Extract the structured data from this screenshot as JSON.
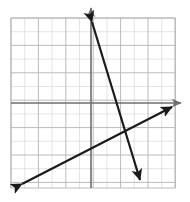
{
  "figure": {
    "name": "coordinate-plane-two-lines",
    "width": 190,
    "height": 202,
    "background_color": "#ffffff"
  },
  "grid": {
    "left": 11,
    "top": 18,
    "right": 175,
    "bottom": 188,
    "cell_size": 13.7,
    "columns": 12,
    "rows": 12,
    "minor_color": "#d9d9d9",
    "major_color": "#b3b3b3",
    "major_every": 2,
    "show_border": true
  },
  "axes": {
    "color": "#6e6e6e",
    "stroke_width": 1.6,
    "x_axis": {
      "label": "x-axis",
      "y_pixel": 103,
      "x_start": 11,
      "x_end": 181,
      "arrow": "right"
    },
    "y_axis": {
      "label": "y-axis",
      "x_pixel": 91,
      "y_start": 188,
      "y_end": 8,
      "arrow": "up"
    },
    "origin": {
      "x_pixel": 91,
      "y_pixel": 103
    },
    "unit_pixels": 13.7
  },
  "chart_data": {
    "type": "line",
    "title": "",
    "subtitle": "",
    "xlabel": "x",
    "ylabel": "y",
    "xlim": [
      -5.8,
      6.1
    ],
    "ylim": [
      -6.2,
      6.2
    ],
    "grid": true,
    "legend": "none",
    "annotations": [],
    "tick_labels": {
      "x": [],
      "y": []
    },
    "intersection": {
      "x": 2.6,
      "y": -2.2,
      "x_pixel": 126,
      "y_pixel": 133
    },
    "series": [
      {
        "name": "steep-decreasing-line",
        "color": "#1a1a1a",
        "stroke_width": 2.2,
        "slope": -3.3,
        "y_intercept": 5.9,
        "x_intercept": 2.3,
        "arrows": [
          "start-up",
          "end-down"
        ],
        "points_graph": [
          {
            "x": 0.07,
            "y": 5.91
          },
          {
            "x": 3.58,
            "y": -5.62
          }
        ],
        "points_pixel": [
          {
            "x": 92,
            "y": 22
          },
          {
            "x": 140,
            "y": 180
          }
        ]
      },
      {
        "name": "shallow-increasing-line",
        "color": "#1a1a1a",
        "stroke_width": 2.2,
        "slope": 0.51,
        "y_intercept": -3.1,
        "x_intercept": 6.0,
        "arrows": [
          "start-down-left",
          "end-up-right"
        ],
        "points_graph": [
          {
            "x": -5.04,
            "y": -5.91
          },
          {
            "x": 5.91,
            "y": -0.29
          }
        ],
        "points_pixel": [
          {
            "x": 22,
            "y": 184
          },
          {
            "x": 172,
            "y": 107
          }
        ]
      }
    ]
  },
  "icons": {
    "x_axis_arrow": "arrow-right-icon",
    "y_axis_arrow": "arrow-up-icon",
    "line_a_start_arrow": "arrow-up-icon",
    "line_a_end_arrow": "arrow-down-icon",
    "line_b_start_arrow": "arrow-down-left-icon",
    "line_b_end_arrow": "arrow-up-right-icon"
  }
}
